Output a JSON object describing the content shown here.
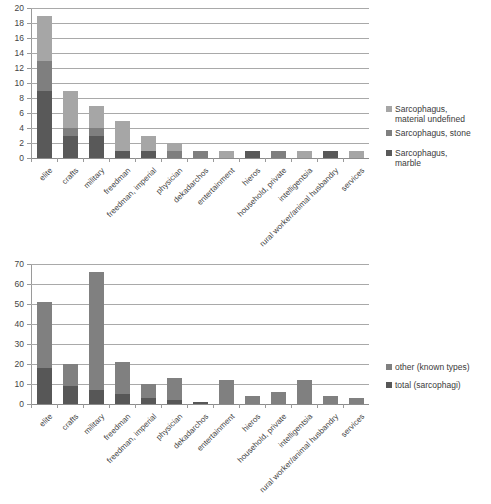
{
  "chart_data": [
    {
      "id": "sarcophagus-by-material",
      "type": "bar",
      "stacked": true,
      "title": "",
      "xlabel": "",
      "ylabel": "",
      "ylim": [
        0,
        20
      ],
      "yticks": [
        0,
        2,
        4,
        6,
        8,
        10,
        12,
        14,
        16,
        18,
        20
      ],
      "grid": true,
      "legend_position": "right",
      "categories": [
        "elite",
        "crafts",
        "military",
        "freedman",
        "freedman, imperial",
        "physician",
        "dekadarchos",
        "entertainment",
        "hieros",
        "household, private",
        "intelligentsia",
        "rural worker/animal husbandry",
        "services"
      ],
      "series": [
        {
          "name": "Sarcophagus,\nmarble",
          "legend_label": "Sarcophagus,\nmarble",
          "color": "#595959",
          "values": [
            9,
            3,
            3,
            1,
            1,
            0,
            0,
            0,
            1,
            0,
            0,
            1,
            0
          ]
        },
        {
          "name": "Sarcophagus, stone",
          "legend_label": "Sarcophagus, stone",
          "color": "#7f7f7f",
          "values": [
            4,
            1,
            1,
            0,
            0,
            1,
            1,
            0,
            0,
            1,
            0,
            0,
            0
          ]
        },
        {
          "name": "Sarcophagus,\nmaterial undefined",
          "legend_label": "Sarcophagus,\nmaterial undefined",
          "color": "#a6a6a6",
          "values": [
            6,
            5,
            3,
            4,
            2,
            1,
            0,
            1,
            0,
            0,
            1,
            0,
            1
          ]
        }
      ],
      "totals": [
        19,
        9,
        7,
        5,
        3,
        2,
        1,
        1,
        1,
        1,
        1,
        1,
        1
      ]
    },
    {
      "id": "totals-vs-other-known-types",
      "type": "bar",
      "stacked": true,
      "title": "",
      "xlabel": "",
      "ylabel": "",
      "ylim": [
        0,
        70
      ],
      "yticks": [
        0,
        10,
        20,
        30,
        40,
        50,
        60,
        70
      ],
      "grid": true,
      "legend_position": "right",
      "categories": [
        "elite",
        "crafts",
        "military",
        "freedman",
        "freedman, imperial",
        "physician",
        "dekadarchos",
        "entertainment",
        "hieros",
        "household, private",
        "intelligentsia",
        "rural worker/animal husbandry",
        "services"
      ],
      "series": [
        {
          "name": "total (sarcophagi)",
          "legend_label": "total (sarcophagi)",
          "color": "#575757",
          "values": [
            18,
            9,
            7,
            5,
            3,
            2,
            1,
            0,
            0,
            0,
            0,
            0,
            0
          ]
        },
        {
          "name": "other (known types)",
          "legend_label": "other (known types)",
          "color": "#808080",
          "values": [
            33,
            11,
            59,
            16,
            7,
            11,
            0,
            12,
            4,
            6,
            12,
            4,
            3
          ]
        }
      ],
      "totals": [
        51,
        20,
        66,
        21,
        10,
        13,
        1,
        12,
        4,
        6,
        12,
        4,
        3
      ]
    }
  ]
}
